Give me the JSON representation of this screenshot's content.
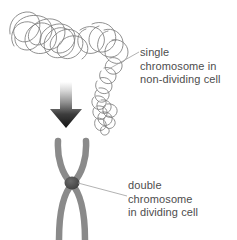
{
  "figure": {
    "background_color": "#ffffff",
    "text_color": "#4d4d4d",
    "chromatid_color": "#8a8a8a",
    "centromere_color": "#4a4a4a",
    "thread_color": "#808080",
    "leader_line_color": "#9a9a9a",
    "arrow_color_top": "#d8d8d8",
    "arrow_color_bottom": "#1a1a1a"
  },
  "labels": {
    "single": {
      "icon": "leader-line-icon",
      "lines": [
        "single",
        "chromosome in",
        "non-dividing cell"
      ]
    },
    "double": {
      "icon": "leader-line-icon",
      "lines": [
        "double",
        "chromosome",
        "in dividing cell"
      ]
    }
  },
  "graphics": {
    "tangled_thread": "single-chromosome-thread-icon",
    "arrow": "down-arrow-icon",
    "condensed_chromosome": "double-chromosome-x-icon",
    "centromere": "centromere-icon"
  }
}
